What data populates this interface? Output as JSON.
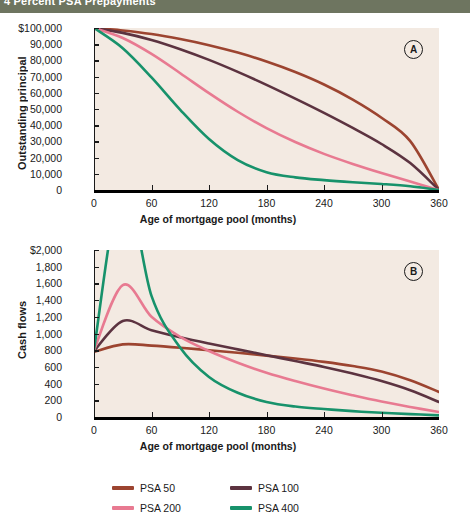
{
  "header": {
    "banner_text": "4 Percent PSA Prepayments",
    "banner_color": "#6e7560"
  },
  "style": {
    "plot_background": "#f3eae2",
    "page_background": "#ffffff",
    "axis_color": "#1a1a1a"
  },
  "panels": [
    {
      "badge": "A",
      "ylabel": "Outstanding principal",
      "xlabel": "Age of mortgage pool (months)"
    },
    {
      "badge": "B",
      "ylabel": "Cash flows",
      "xlabel": "Age of mortgage pool (months)"
    }
  ],
  "legend": {
    "items": [
      {
        "label": "PSA 50",
        "color": "#9c4430"
      },
      {
        "label": "PSA 100",
        "color": "#5c3340"
      },
      {
        "label": "PSA 200",
        "color": "#e87a91"
      },
      {
        "label": "PSA 400",
        "color": "#17926b"
      }
    ]
  },
  "chart_data": [
    {
      "type": "line",
      "title": "",
      "panel": "A",
      "xlabel": "Age of mortgage pool (months)",
      "ylabel": "Outstanding principal",
      "xlim": [
        0,
        360
      ],
      "ylim": [
        0,
        100000
      ],
      "xticks": [
        0,
        60,
        120,
        180,
        240,
        300,
        360
      ],
      "xtick_labels": [
        "0",
        "60",
        "120",
        "180",
        "240",
        "300",
        "360"
      ],
      "yticks": [
        0,
        10000,
        20000,
        30000,
        40000,
        50000,
        60000,
        70000,
        80000,
        90000,
        100000
      ],
      "ytick_labels": [
        "0",
        "10,000",
        "20,000",
        "30,000",
        "40,000",
        "50,000",
        "60,000",
        "70,000",
        "80,000",
        "90,000",
        "$100,000"
      ],
      "grid": false,
      "legend_position": "bottom",
      "x": [
        0,
        30,
        60,
        90,
        120,
        150,
        180,
        210,
        240,
        270,
        300,
        330,
        360
      ],
      "series": [
        {
          "name": "PSA 50",
          "color": "#9c4430",
          "values": [
            100000,
            98500,
            96300,
            93200,
            89400,
            84800,
            79300,
            72800,
            65100,
            55800,
            44600,
            30200,
            0
          ]
        },
        {
          "name": "PSA 100",
          "color": "#5c3340",
          "values": [
            100000,
            97000,
            92600,
            86900,
            80300,
            72900,
            64900,
            56400,
            47600,
            38300,
            28400,
            16600,
            0
          ]
        },
        {
          "name": "PSA 200",
          "color": "#e87a91",
          "values": [
            100000,
            93800,
            84000,
            72100,
            59800,
            48300,
            38200,
            29600,
            22300,
            16100,
            10500,
            5200,
            0
          ]
        },
        {
          "name": "PSA 400",
          "color": "#17926b",
          "values": [
            100000,
            87500,
            69500,
            49500,
            31500,
            18500,
            11000,
            7800,
            6100,
            4800,
            3700,
            2300,
            0
          ]
        }
      ]
    },
    {
      "type": "line",
      "title": "",
      "panel": "B",
      "xlabel": "Age of mortgage pool (months)",
      "ylabel": "Cash flows",
      "xlim": [
        0,
        360
      ],
      "ylim": [
        0,
        2000
      ],
      "xticks": [
        0,
        60,
        120,
        180,
        240,
        300,
        360
      ],
      "xtick_labels": [
        "0",
        "60",
        "120",
        "180",
        "240",
        "300",
        "360"
      ],
      "yticks": [
        0,
        200,
        400,
        600,
        800,
        1000,
        1200,
        1400,
        1600,
        1800,
        2000
      ],
      "ytick_labels": [
        "0",
        "200",
        "400",
        "600",
        "800",
        "1,000",
        "1,200",
        "1,400",
        "1,600",
        "1,800",
        "$2,000"
      ],
      "grid": false,
      "legend_position": "bottom",
      "x": [
        0,
        30,
        60,
        90,
        120,
        150,
        180,
        210,
        240,
        270,
        300,
        330,
        360
      ],
      "series": [
        {
          "name": "PSA 50",
          "color": "#9c4430",
          "values": [
            780,
            870,
            855,
            830,
            800,
            770,
            735,
            700,
            660,
            610,
            545,
            440,
            300
          ]
        },
        {
          "name": "PSA 100",
          "color": "#5c3340",
          "values": [
            790,
            1150,
            1040,
            955,
            880,
            810,
            740,
            670,
            600,
            520,
            430,
            320,
            180
          ]
        },
        {
          "name": "PSA 200",
          "color": "#e87a91",
          "values": [
            800,
            1580,
            1200,
            960,
            790,
            650,
            530,
            430,
            340,
            260,
            185,
            120,
            60
          ]
        },
        {
          "name": "PSA 400",
          "color": "#17926b",
          "values": [
            810,
            2800,
            1450,
            830,
            480,
            290,
            180,
            125,
            95,
            70,
            50,
            35,
            20
          ]
        }
      ]
    }
  ]
}
